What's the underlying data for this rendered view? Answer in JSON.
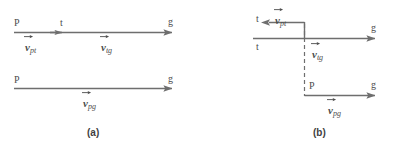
{
  "figure": {
    "stroke_color": "#6e6e6e",
    "text_color": "#4d4d4d",
    "background": "#ffffff",
    "panels": [
      {
        "id": "a",
        "caption": "(a)",
        "arrows": [
          {
            "name": "v-pt-arrow-a",
            "label": "v",
            "subscript": "pt",
            "from_point": "P",
            "to_point": "t",
            "direction": "right"
          },
          {
            "name": "v-tg-arrow-a",
            "label": "v",
            "subscript": "tg",
            "from_point": "t",
            "to_point": "g",
            "direction": "right"
          },
          {
            "name": "v-pg-arrow-a",
            "label": "v",
            "subscript": "pg",
            "from_point": "P",
            "to_point": "g",
            "direction": "right"
          }
        ],
        "point_labels": [
          "P",
          "t",
          "g",
          "P",
          "g"
        ]
      },
      {
        "id": "b",
        "caption": "(b)",
        "arrows": [
          {
            "name": "v-pt-arrow-b",
            "label": "v",
            "subscript": "pt",
            "from_point": "t",
            "to_point": "t",
            "direction": "left"
          },
          {
            "name": "v-tg-arrow-b",
            "label": "v",
            "subscript": "tg",
            "from_point": "t",
            "to_point": "g",
            "direction": "right"
          },
          {
            "name": "v-pg-arrow-b",
            "label": "v",
            "subscript": "pg",
            "from_point": "P",
            "to_point": "g",
            "direction": "right"
          }
        ],
        "point_labels": [
          "t",
          "t",
          "g",
          "P",
          "g"
        ]
      }
    ]
  },
  "labels": {
    "a_top_left_P": "P",
    "a_top_mid_t": "t",
    "a_top_right_g": "g",
    "a_vec_pt_base": "v",
    "a_vec_pt_sub": "pt",
    "a_vec_tg_base": "v",
    "a_vec_tg_sub": "tg",
    "a_bot_left_P": "P",
    "a_bot_right_g": "g",
    "a_vec_pg_base": "v",
    "a_vec_pg_sub": "pg",
    "a_caption": "(a)",
    "b_upper_t": "t",
    "b_vec_pt_base": "v",
    "b_vec_pt_sub": "pt",
    "b_lower_t": "t",
    "b_top_right_g": "g",
    "b_vec_tg_base": "v",
    "b_vec_tg_sub": "tg",
    "b_bot_P": "P",
    "b_bot_right_g": "g",
    "b_vec_pg_base": "v",
    "b_vec_pg_sub": "pg",
    "b_caption": "(b)"
  }
}
